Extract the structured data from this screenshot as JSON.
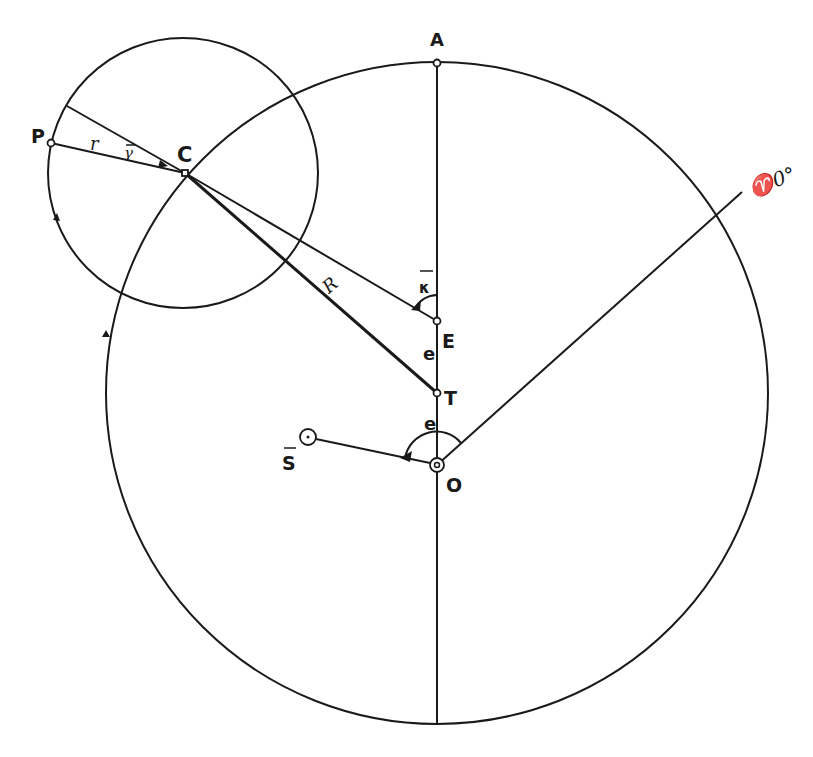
{
  "diagram": {
    "labels": {
      "A": "A",
      "P": "P",
      "C": "C",
      "r": "r",
      "gamma": "γ",
      "R": "R",
      "kappa": "κ",
      "E": "E",
      "e_upper": "e",
      "T": "T",
      "e_lower": "e",
      "S": "S",
      "O": "O",
      "aries": "♈0°"
    },
    "points": {
      "A": [
        437,
        63
      ],
      "P": [
        51,
        143
      ],
      "C": [
        185,
        173
      ],
      "E": [
        437,
        321
      ],
      "T": [
        437,
        393
      ],
      "O": [
        437,
        465
      ],
      "S": [
        308,
        437
      ],
      "epicycle_edge": [
        67,
        106
      ],
      "aries_end": [
        742,
        192
      ]
    },
    "circles": {
      "deferent": {
        "cx": 437,
        "cy": 393,
        "r": 331
      },
      "epicycle": {
        "cx": 183,
        "cy": 173,
        "r": 135
      }
    },
    "colors": {
      "ink": "#1a1a1a",
      "background": "#ffffff"
    }
  }
}
